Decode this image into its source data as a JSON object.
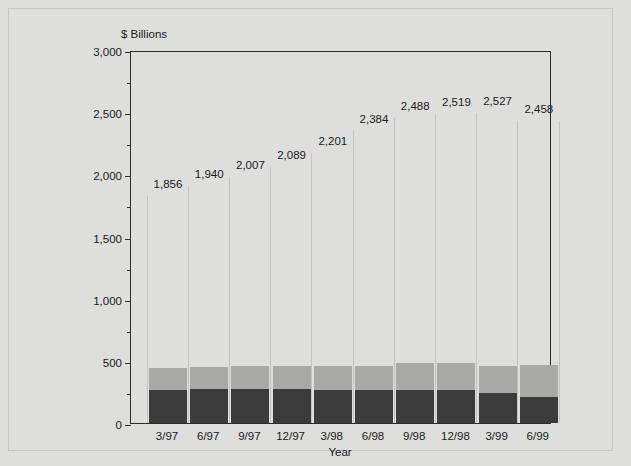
{
  "chart_data": {
    "type": "bar",
    "title": "",
    "ylabel": "$ Billions",
    "xlabel": "Year",
    "ylim": [
      0,
      3000
    ],
    "yticks": [
      "0",
      "500",
      "1,000",
      "1,500",
      "2,000",
      "2,500",
      "3,000"
    ],
    "ytick_values": [
      0,
      500,
      1000,
      1500,
      2000,
      2500,
      3000
    ],
    "minor_tick_values": [
      250,
      750,
      1250,
      1750,
      2250,
      2750
    ],
    "grid": false,
    "legend": "none",
    "stacked": true,
    "categories": [
      "3/97",
      "6/97",
      "9/97",
      "12/97",
      "3/98",
      "6/98",
      "9/98",
      "12/98",
      "3/99",
      "6/99"
    ],
    "data_labels": [
      "1,856",
      "1,940",
      "2,007",
      "2,089",
      "2,201",
      "2,384",
      "2,488",
      "2,519",
      "2,527",
      "2,458"
    ],
    "data_label_values": [
      1856,
      1940,
      2007,
      2089,
      2201,
      2384,
      2488,
      2519,
      2527,
      2458
    ],
    "series": [
      {
        "name": "lower-segment",
        "color": "#3b3b3b",
        "values": [
          265,
          270,
          270,
          275,
          265,
          265,
          265,
          265,
          240,
          210
        ]
      },
      {
        "name": "upper-segment",
        "color": "#a9a9a8",
        "values": [
          175,
          180,
          185,
          185,
          195,
          195,
          215,
          215,
          215,
          260
        ]
      }
    ],
    "totals": [
      440,
      450,
      455,
      460,
      460,
      460,
      480,
      480,
      455,
      470
    ]
  },
  "colors": {
    "background": "#dededd",
    "axis": "#2b2b2b",
    "bar_dark": "#3b3b3b",
    "bar_light": "#a9a9a8",
    "separator": "#c3c3c2",
    "text": "#1a1a1a"
  }
}
